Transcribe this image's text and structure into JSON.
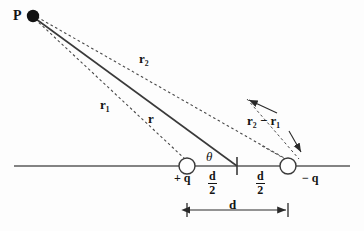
{
  "diagram": {
    "type": "physics-vector-diagram",
    "background_color": "#fdfdfd",
    "stroke_color": "#3c3c3c",
    "text_color": "#141414",
    "labels": {
      "point_p": "P",
      "r2": "r₂",
      "r1": "r₁",
      "r": "r",
      "theta": "θ",
      "difference": "r₂ − r₁",
      "positive_charge": "+ q",
      "negative_charge": "− q",
      "separation": "d",
      "half_separation_numerator": "d",
      "half_separation_denominator": "2"
    },
    "geometry": {
      "point_p": {
        "x": 33,
        "y": 16,
        "radius": 6
      },
      "positive_charge": {
        "x": 187,
        "y": 166,
        "radius": 8
      },
      "negative_charge": {
        "x": 288,
        "y": 166,
        "radius": 8
      },
      "midpoint": {
        "x": 237,
        "y": 166
      },
      "baseline": {
        "x1": 14,
        "y1": 166,
        "x2": 350,
        "y2": 166
      },
      "dimension_line": {
        "x1": 187,
        "y1": 210,
        "x2": 288,
        "y2": 210
      }
    }
  }
}
